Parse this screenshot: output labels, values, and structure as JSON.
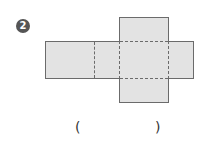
{
  "problem": {
    "number": "2",
    "answer_open": "(",
    "answer_close": ")"
  },
  "net": {
    "type": "rectangular-box-net",
    "fill_color": "#e3e3e3",
    "line_color": "#6b6b6b",
    "faces": [
      {
        "name": "top-flap",
        "x": 119,
        "y": 17,
        "w": 49,
        "h": 24
      },
      {
        "name": "left-face",
        "x": 45,
        "y": 41,
        "w": 49,
        "h": 37
      },
      {
        "name": "left-mid-face",
        "x": 94,
        "y": 41,
        "w": 25,
        "h": 37
      },
      {
        "name": "center-face",
        "x": 119,
        "y": 41,
        "w": 49,
        "h": 37
      },
      {
        "name": "right-face",
        "x": 168,
        "y": 41,
        "w": 25,
        "h": 37
      },
      {
        "name": "bottom-flap",
        "x": 119,
        "y": 78,
        "w": 49,
        "h": 24
      }
    ]
  }
}
